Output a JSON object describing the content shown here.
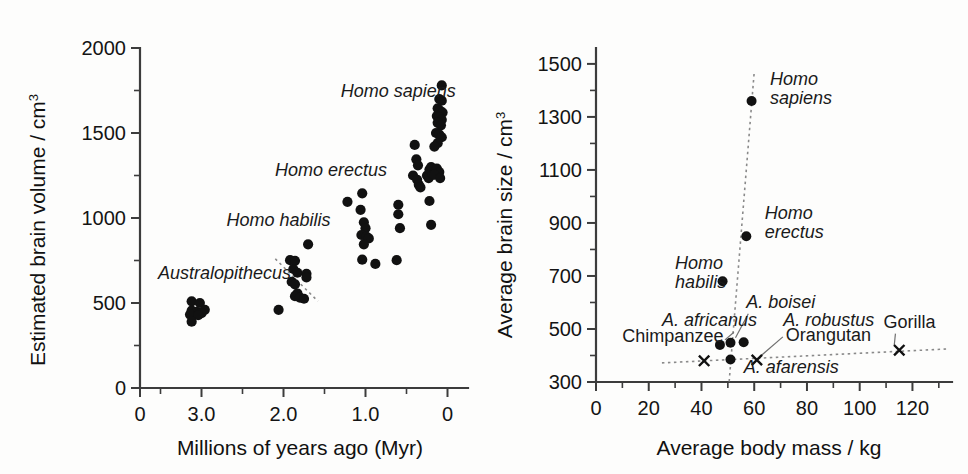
{
  "figure": {
    "panels": [
      "left",
      "right"
    ],
    "background_color": "#fdfdfc",
    "marker_color": "#111111",
    "trendline_color": "#8a8a8a"
  },
  "left_panel": {
    "ylabel_main": "Estimated brain volume / cm",
    "ylabel_sup": "3",
    "xlabel": "Millions of years ago (Myr)",
    "y_ticklabels": [
      "0",
      "500",
      "1000",
      "1500",
      "2000"
    ],
    "x_ticklabels": [
      "0",
      "3.0",
      "2.0",
      "1.0",
      "0"
    ],
    "annotations": [
      {
        "text": "Australopithecus",
        "x": 0.0,
        "y": 0.0
      },
      {
        "text": "Homo habilis",
        "x": 0.0,
        "y": 0.0
      },
      {
        "text": "Homo erectus",
        "x": 0.0,
        "y": 0.0
      },
      {
        "text": "Homo sapiens",
        "x": 0.0,
        "y": 0.0
      }
    ]
  },
  "right_panel": {
    "ylabel_main": "Average brain size / cm",
    "ylabel_sup": "3",
    "xlabel": "Average body mass / kg",
    "y_ticklabels": [
      "300",
      "500",
      "700",
      "900",
      "1100",
      "1300",
      "1500"
    ],
    "x_ticklabels": [
      "0",
      "20",
      "40",
      "60",
      "80",
      "100",
      "120"
    ],
    "point_labels": [
      "Homo sapiens",
      "Homo erectus",
      "Homo habilis",
      "A. boisei",
      "A. africanus",
      "A. robustus",
      "A. afarensis",
      "Chimpanzee",
      "Orangutan",
      "Gorilla"
    ]
  },
  "chart_data": [
    {
      "id": "left",
      "type": "scatter",
      "title": "",
      "xlabel": "Millions of years ago (Myr)",
      "ylabel": "Estimated brain volume / cm3",
      "xlim": [
        3.75,
        -0.25
      ],
      "ylim": [
        0,
        2000
      ],
      "x_reversed": true,
      "grid": false,
      "legend": "none",
      "xticks": [
        3.75,
        3.0,
        2.0,
        1.0,
        0.0
      ],
      "xtick_labels": [
        "0",
        "3.0",
        "2.0",
        "1.0",
        "0"
      ],
      "yticks": [
        0,
        500,
        1000,
        1500,
        2000
      ],
      "ytick_labels": [
        "0",
        "500",
        "1000",
        "1500",
        "2000"
      ],
      "yticks_minor": [
        250,
        750,
        1250,
        1750
      ],
      "series": [
        {
          "name": "Australopithecus",
          "label_x": 2.72,
          "label_y": 640,
          "points": [
            [
              3.12,
              510
            ],
            [
              3.02,
              500
            ],
            [
              2.96,
              460
            ],
            [
              3.12,
              455
            ],
            [
              3.06,
              448
            ],
            [
              3.0,
              440
            ],
            [
              3.14,
              432
            ],
            [
              3.04,
              428
            ],
            [
              3.12,
              390
            ]
          ]
        },
        {
          "name": "Homo habilis",
          "label_x": 2.06,
          "label_y": 955,
          "points": [
            [
              2.06,
              460
            ],
            [
              1.92,
              752
            ],
            [
              1.86,
              748
            ],
            [
              1.88,
              700
            ],
            [
              1.83,
              678
            ],
            [
              1.9,
              625
            ],
            [
              1.86,
              610
            ],
            [
              1.83,
              556
            ],
            [
              1.86,
              540
            ],
            [
              1.8,
              532
            ],
            [
              1.75,
              525
            ],
            [
              1.7,
              845
            ],
            [
              1.72,
              672
            ],
            [
              1.72,
              650
            ]
          ]
        },
        {
          "name": "Homo erectus",
          "label_x": 1.42,
          "label_y": 1245,
          "points": [
            [
              1.22,
              1095
            ],
            [
              1.04,
              1145
            ],
            [
              1.06,
              1048
            ],
            [
              1.02,
              975
            ],
            [
              1.0,
              940
            ],
            [
              1.05,
              900
            ],
            [
              0.99,
              890
            ],
            [
              0.96,
              880
            ],
            [
              1.02,
              845
            ],
            [
              1.04,
              755
            ],
            [
              0.88,
              730
            ],
            [
              0.62,
              752
            ],
            [
              0.6,
              1022
            ],
            [
              0.6,
              1078
            ],
            [
              0.58,
              940
            ]
          ]
        },
        {
          "name": "Homo sapiens",
          "label_x": 0.6,
          "label_y": 1710,
          "points": [
            [
              0.4,
              1430
            ],
            [
              0.38,
              1345
            ],
            [
              0.36,
              1310
            ],
            [
              0.42,
              1250
            ],
            [
              0.37,
              1225
            ],
            [
              0.35,
              1195
            ],
            [
              0.33,
              1180
            ],
            [
              0.25,
              1250
            ],
            [
              0.23,
              1235
            ],
            [
              0.22,
              1285
            ],
            [
              0.2,
              1300
            ],
            [
              0.18,
              1255
            ],
            [
              0.22,
              1100
            ],
            [
              0.2,
              960
            ],
            [
              0.07,
              1780
            ],
            [
              0.1,
              1700
            ],
            [
              0.07,
              1690
            ],
            [
              0.12,
              1645
            ],
            [
              0.09,
              1630
            ],
            [
              0.06,
              1620
            ],
            [
              0.13,
              1600
            ],
            [
              0.1,
              1592
            ],
            [
              0.07,
              1578
            ],
            [
              0.12,
              1560
            ],
            [
              0.08,
              1545
            ],
            [
              0.14,
              1500
            ],
            [
              0.1,
              1490
            ],
            [
              0.07,
              1475
            ],
            [
              0.12,
              1440
            ],
            [
              0.16,
              1420
            ],
            [
              0.13,
              1290
            ],
            [
              0.1,
              1270
            ],
            [
              0.16,
              1255
            ],
            [
              0.09,
              1235
            ]
          ]
        }
      ],
      "trendlines": [
        {
          "name": "habilis-dashed",
          "style": "dotted",
          "x1": 2.1,
          "y1": 760,
          "x2": 1.58,
          "y2": 510
        }
      ]
    },
    {
      "id": "right",
      "type": "scatter",
      "title": "",
      "xlabel": "Average body mass / kg",
      "ylabel": "Average brain size / cm3",
      "xlim": [
        0,
        135
      ],
      "ylim": [
        300,
        1560
      ],
      "grid": false,
      "legend": "none",
      "xticks": [
        0,
        20,
        40,
        60,
        80,
        100,
        120
      ],
      "xtick_labels": [
        "0",
        "20",
        "40",
        "60",
        "80",
        "100",
        "120"
      ],
      "xticks_minor": [
        10,
        30,
        50,
        70,
        90,
        110,
        130
      ],
      "yticks": [
        300,
        500,
        700,
        900,
        1100,
        1300,
        1500
      ],
      "ytick_labels": [
        "300",
        "500",
        "700",
        "900",
        "1100",
        "1300",
        "1500"
      ],
      "yticks_minor": [
        400,
        600,
        800,
        1000,
        1200,
        1400
      ],
      "points": [
        {
          "name": "Homo sapiens",
          "x": 59,
          "y": 1360,
          "marker": "dot",
          "label": "Homo sapiens",
          "label_italic": true,
          "label_x": 66,
          "label_y": 1420,
          "leader": false
        },
        {
          "name": "Homo erectus",
          "x": 57,
          "y": 850,
          "marker": "dot",
          "label": "Homo erectus",
          "label_italic": true,
          "label_x": 64,
          "label_y": 915,
          "leader": false
        },
        {
          "name": "Homo habilis",
          "x": 48,
          "y": 680,
          "marker": "dot",
          "label": "Homo habilis",
          "label_italic": true,
          "label_x": 30,
          "label_y": 725,
          "leader": false
        },
        {
          "name": "A. africanus",
          "x": 47,
          "y": 440,
          "marker": "dot",
          "label": "A. africanus",
          "label_italic": true,
          "label_x": 25,
          "label_y": 510,
          "leader": true
        },
        {
          "name": "A. boisei",
          "x": 51,
          "y": 448,
          "marker": "dot",
          "label": "A. boisei",
          "label_italic": true,
          "label_x": 57,
          "label_y": 580,
          "leader": true
        },
        {
          "name": "A. robustus",
          "x": 56,
          "y": 450,
          "marker": "dot",
          "label": "A. robustus",
          "label_italic": true,
          "label_x": 71,
          "label_y": 510,
          "leader": false
        },
        {
          "name": "A. afarensis",
          "x": 51,
          "y": 385,
          "marker": "dot",
          "label": "A. afarensis",
          "label_italic": true,
          "label_x": 56,
          "label_y": 335,
          "leader": false
        },
        {
          "name": "Chimpanzee",
          "x": 41,
          "y": 380,
          "marker": "cross",
          "label": "Chimpanzee",
          "label_italic": false,
          "label_x": 10,
          "label_y": 452,
          "leader": false
        },
        {
          "name": "Orangutan",
          "x": 61,
          "y": 383,
          "marker": "cross",
          "label": "Orangutan",
          "label_italic": false,
          "label_x": 72,
          "label_y": 455,
          "leader": true
        },
        {
          "name": "Gorilla",
          "x": 115,
          "y": 420,
          "marker": "cross",
          "label": "Gorilla",
          "label_italic": false,
          "label_x": 109,
          "label_y": 505,
          "leader": true
        }
      ],
      "trendlines": [
        {
          "name": "hominin-line",
          "style": "dotted",
          "x1": 50.5,
          "y1": 302,
          "x2": 60,
          "y2": 1470
        },
        {
          "name": "ape-line",
          "style": "dotted",
          "x1": 25,
          "y1": 372,
          "x2": 134,
          "y2": 425
        }
      ]
    }
  ]
}
